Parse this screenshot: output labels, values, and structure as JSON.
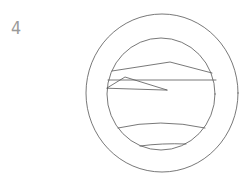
{
  "drawing": {
    "label": "4",
    "subject": "porthole window with horizon landscape",
    "style": "pencil sketch",
    "colors": {
      "background": "#ffffff",
      "stroke": "#555555",
      "label": "#9a9a9a"
    },
    "outer_ring": {
      "cx": 162,
      "cy": 93,
      "rx": 76,
      "ry": 79
    },
    "inner_window": {
      "cx": 161,
      "cy": 94,
      "rx": 54,
      "ry": 56
    }
  }
}
